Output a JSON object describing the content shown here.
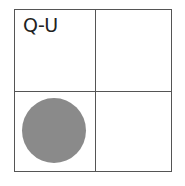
{
  "diagram": {
    "label": "Q-U",
    "cells": [
      {
        "position": "top-left",
        "label": "Q-U",
        "filled": false
      },
      {
        "position": "top-right",
        "filled": false
      },
      {
        "position": "bottom-left",
        "filled": true,
        "shape": "circle"
      },
      {
        "position": "bottom-right",
        "filled": false
      }
    ],
    "colors": {
      "line": "#555555",
      "circle": "#8a8a8a"
    }
  }
}
